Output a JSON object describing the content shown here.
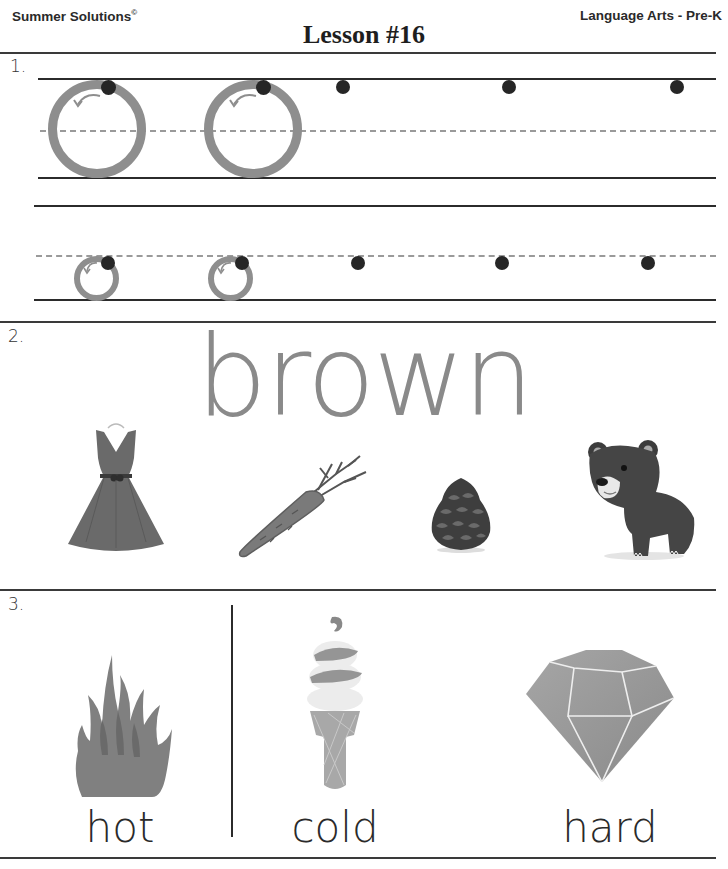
{
  "header": {
    "brand": "Summer Solutions",
    "brand_mark": "©",
    "title": "Lesson #16",
    "subject": "Language Arts - Pre-K"
  },
  "sections": [
    {
      "number": "1.",
      "type": "letter-tracing",
      "letter": "o",
      "rows": [
        {
          "size": "uppercase-height",
          "traced_examples": 2,
          "start_dots": 5
        },
        {
          "size": "lowercase-height",
          "traced_examples": 2,
          "start_dots": 5
        }
      ]
    },
    {
      "number": "2.",
      "type": "color-word",
      "word": "brown",
      "pictures": [
        "dress",
        "carrot",
        "pinecone",
        "bear"
      ]
    },
    {
      "number": "3.",
      "type": "opposites",
      "items": [
        {
          "picture": "fire",
          "label": "hot"
        },
        {
          "picture": "ice-cream-cone",
          "label": "cold"
        },
        {
          "picture": "diamond",
          "label": "hard"
        }
      ]
    }
  ],
  "colors": {
    "rule": "#3a3a3a",
    "trace_gray": "#8e8e8e",
    "dot": "#262626",
    "word_gray": "#8a8a8a"
  }
}
